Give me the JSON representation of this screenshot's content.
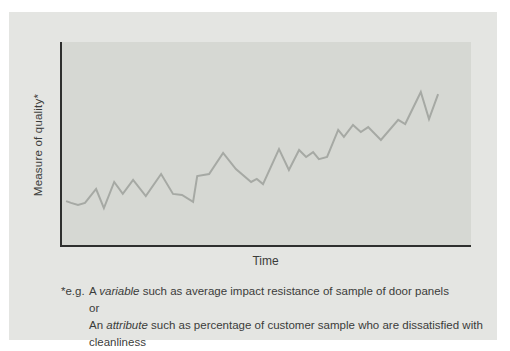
{
  "chart_data": {
    "type": "line",
    "title": "",
    "xlabel": "Time",
    "ylabel": "Measure of quality*",
    "x_range": [
      0,
      100
    ],
    "y_range": [
      0,
      100
    ],
    "grid": false,
    "legend": "none",
    "axis_ticks": "none",
    "series": [
      {
        "name": "measure-of-quality",
        "color": "#a6a9a4",
        "points": [
          [
            1.0,
            22.4
          ],
          [
            2.2,
            21.5
          ],
          [
            3.9,
            20.5
          ],
          [
            5.6,
            21.5
          ],
          [
            8.3,
            28.3
          ],
          [
            10.2,
            19.0
          ],
          [
            12.7,
            31.7
          ],
          [
            14.8,
            25.9
          ],
          [
            17.3,
            32.7
          ],
          [
            20.4,
            24.9
          ],
          [
            24.1,
            35.6
          ],
          [
            27.0,
            25.9
          ],
          [
            29.2,
            25.4
          ],
          [
            31.9,
            22.0
          ],
          [
            32.9,
            34.6
          ],
          [
            35.8,
            35.6
          ],
          [
            39.2,
            45.9
          ],
          [
            42.3,
            38.0
          ],
          [
            46.0,
            31.7
          ],
          [
            47.4,
            33.2
          ],
          [
            48.9,
            30.7
          ],
          [
            52.8,
            47.8
          ],
          [
            55.2,
            37.6
          ],
          [
            57.7,
            47.3
          ],
          [
            59.4,
            43.9
          ],
          [
            61.1,
            46.3
          ],
          [
            62.5,
            42.9
          ],
          [
            64.5,
            43.9
          ],
          [
            67.2,
            57.1
          ],
          [
            68.6,
            53.7
          ],
          [
            70.8,
            59.5
          ],
          [
            72.7,
            56.1
          ],
          [
            74.5,
            58.5
          ],
          [
            77.6,
            52.2
          ],
          [
            81.8,
            62.0
          ],
          [
            83.5,
            60.0
          ],
          [
            87.3,
            75.6
          ],
          [
            89.3,
            62.4
          ],
          [
            91.5,
            74.6
          ]
        ]
      }
    ]
  },
  "footnote": {
    "marker": "*e.g.",
    "line1": {
      "prefix": "A ",
      "italic": "variable",
      "rest": " such as average impact resistance of sample of door panels"
    },
    "connector": "or",
    "line2": {
      "prefix": "An ",
      "italic": "attribute",
      "rest": " such as percentage of customer sample who are dissatisfied with cleanliness"
    }
  },
  "colors": {
    "page_background": "#ffffff",
    "panel_background": "#e4e5e2",
    "plot_background": "#d6d8d3",
    "axis": "#2e2f2e",
    "line": "#a6a9a4",
    "text": "#3b3c3a"
  }
}
